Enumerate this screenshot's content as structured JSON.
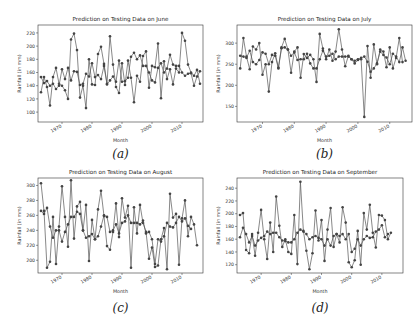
{
  "chart_data": [
    {
      "type": "line",
      "title": "Prediction on Testing Data on June",
      "xlabel": "Month",
      "ylabel": "Rainfall (in mm)",
      "caption": "(a)",
      "xticks": [
        "1970",
        "1980",
        "1990",
        "2000",
        "2010"
      ],
      "yticks": [
        "100",
        "120",
        "140",
        "160",
        "180",
        "200",
        "220"
      ],
      "ylim": [
        85,
        232
      ],
      "xlim": [
        1962,
        2017
      ],
      "x": [
        1963,
        1964,
        1965,
        1966,
        1967,
        1968,
        1969,
        1970,
        1971,
        1972,
        1973,
        1974,
        1975,
        1976,
        1977,
        1978,
        1979,
        1980,
        1981,
        1982,
        1983,
        1984,
        1985,
        1986,
        1987,
        1988,
        1989,
        1990,
        1991,
        1992,
        1993,
        1994,
        1995,
        1996,
        1997,
        1998,
        1999,
        2000,
        2001,
        2002,
        2003,
        2004,
        2005,
        2006,
        2007,
        2008,
        2009,
        2010,
        2011,
        2012,
        2013,
        2014,
        2015,
        2016
      ],
      "series": [
        {
          "name": "Actual",
          "values": [
            130,
            153,
            138,
            110,
            153,
            167,
            143,
            140,
            133,
            120,
            210,
            219,
            194,
            122,
            140,
            106,
            180,
            142,
            141,
            188,
            199,
            173,
            143,
            215,
            172,
            138,
            129,
            174,
            141,
            178,
            152,
            115,
            155,
            146,
            185,
            192,
            137,
            170,
            168,
            204,
            121,
            177,
            150,
            165,
            142,
            166,
            160,
            220,
            208,
            172,
            160,
            155,
            164,
            143,
            195,
            155,
            203,
            90,
            138,
            185,
            112,
            228,
            91
          ]
        },
        {
          "name": "Predicted",
          "values": [
            153,
            144,
            147,
            140,
            143,
            135,
            140,
            165,
            150,
            167,
            148,
            162,
            161,
            141,
            143,
            158,
            154,
            174,
            153,
            156,
            150,
            170,
            142,
            148,
            154,
            146,
            178,
            146,
            147,
            152,
            184,
            190,
            180,
            186,
            170,
            170,
            160,
            148,
            145,
            167,
            174,
            160,
            166,
            187,
            172,
            170,
            170,
            160,
            155,
            158,
            159,
            140,
            154,
            162,
            142,
            178,
            156,
            150,
            177,
            163,
            125,
            156,
            160,
            180
          ]
        }
      ]
    },
    {
      "type": "line",
      "title": "Prediction on Testing Data on July",
      "xlabel": "Month",
      "ylabel": "Rainfall (in mm)",
      "caption": "(b)",
      "xticks": [
        "1970",
        "1980",
        "1990",
        "2000",
        "2010"
      ],
      "yticks": [
        "150",
        "200",
        "250",
        "300"
      ],
      "ylim": [
        113,
        343
      ],
      "xlim": [
        1962,
        2017
      ],
      "x": [
        1963,
        1964,
        1965,
        1966,
        1967,
        1968,
        1969,
        1970,
        1971,
        1972,
        1973,
        1974,
        1975,
        1976,
        1977,
        1978,
        1979,
        1980,
        1981,
        1982,
        1983,
        1984,
        1985,
        1986,
        1987,
        1988,
        1989,
        1990,
        1991,
        1992,
        1993,
        1994,
        1995,
        1996,
        1997,
        1998,
        1999,
        2000,
        2001,
        2002,
        2003,
        2004,
        2005,
        2006,
        2007,
        2008,
        2009,
        2010,
        2011,
        2012,
        2013,
        2014,
        2015,
        2016
      ],
      "series": [
        {
          "name": "Actual",
          "values": [
            240,
            312,
            268,
            238,
            292,
            285,
            300,
            225,
            250,
            185,
            255,
            276,
            242,
            290,
            310,
            285,
            230,
            280,
            290,
            218,
            274,
            265,
            272,
            262,
            208,
            322,
            287,
            262,
            285,
            258,
            280,
            333,
            285,
            245,
            270,
            262,
            252,
            260,
            262,
            125,
            293,
            218,
            297,
            250,
            285,
            280,
            243,
            290,
            240,
            265,
            312,
            255
          ]
        },
        {
          "name": "Predicted",
          "values": [
            270,
            268,
            265,
            282,
            255,
            250,
            260,
            278,
            275,
            250,
            272,
            270,
            240,
            288,
            290,
            285,
            270,
            278,
            260,
            262,
            262,
            275,
            252,
            240,
            240,
            262,
            282,
            268,
            270,
            275,
            262,
            268,
            268,
            268,
            268,
            262,
            258,
            262,
            265,
            268,
            256,
            232,
            240,
            252,
            280,
            272,
            266,
            250,
            275,
            268,
            255,
            290,
            258
          ]
        }
      ]
    },
    {
      "type": "line",
      "title": "Prediction on Testing Data on August",
      "xlabel": "Month",
      "ylabel": "Rainfall (in mm)",
      "caption": "(c)",
      "xticks": [
        "1970",
        "1980",
        "1990",
        "2000",
        "2010"
      ],
      "yticks": [
        "200",
        "220",
        "240",
        "260",
        "280",
        "300"
      ],
      "ylim": [
        183,
        310
      ],
      "xlim": [
        1962,
        2017
      ],
      "x": [
        1963,
        1964,
        1965,
        1966,
        1967,
        1968,
        1969,
        1970,
        1971,
        1972,
        1973,
        1974,
        1975,
        1976,
        1977,
        1978,
        1979,
        1980,
        1981,
        1982,
        1983,
        1984,
        1985,
        1986,
        1987,
        1988,
        1989,
        1990,
        1991,
        1992,
        1993,
        1994,
        1995,
        1996,
        1997,
        1998,
        1999,
        2000,
        2001,
        2002,
        2003,
        2004,
        2005,
        2006,
        2007,
        2008,
        2009,
        2010,
        2011,
        2012,
        2013,
        2014,
        2015,
        2016
      ],
      "series": [
        {
          "name": "Actual",
          "values": [
            303,
            266,
            190,
            198,
            258,
            195,
            245,
            299,
            258,
            218,
            307,
            229,
            272,
            278,
            240,
            274,
            199,
            254,
            228,
            268,
            293,
            259,
            219,
            214,
            238,
            276,
            231,
            283,
            257,
            273,
            190,
            271,
            236,
            274,
            250,
            238,
            202,
            217,
            191,
            193,
            228,
            243,
            188,
            289,
            257,
            262,
            194,
            256,
            280,
            232,
            258,
            248,
            220
          ]
        },
        {
          "name": "Predicted",
          "values": [
            266,
            262,
            270,
            245,
            230,
            240,
            240,
            225,
            238,
            248,
            258,
            258,
            265,
            262,
            240,
            230,
            232,
            235,
            228,
            232,
            245,
            260,
            258,
            238,
            240,
            248,
            236,
            250,
            252,
            260,
            250,
            250,
            250,
            248,
            253,
            236,
            238,
            228,
            195,
            228,
            225,
            232,
            250,
            245,
            244,
            250,
            258,
            252,
            256,
            246,
            242
          ]
        }
      ]
    },
    {
      "type": "line",
      "title": "Prediction on Testing Data on September",
      "xlabel": "Month",
      "ylabel": "Rainfall (in mm)",
      "caption": "(d)",
      "xticks": [
        "1970",
        "1980",
        "1990",
        "2000",
        "2010"
      ],
      "yticks": [
        "120",
        "140",
        "160",
        "180",
        "200",
        "220",
        "240"
      ],
      "ylim": [
        107,
        256
      ],
      "xlim": [
        1962,
        2017
      ],
      "x": [
        1963,
        1964,
        1965,
        1966,
        1967,
        1968,
        1969,
        1970,
        1971,
        1972,
        1973,
        1974,
        1975,
        1976,
        1977,
        1978,
        1979,
        1980,
        1981,
        1982,
        1983,
        1984,
        1985,
        1986,
        1987,
        1988,
        1989,
        1990,
        1991,
        1992,
        1993,
        1994,
        1995,
        1996,
        1997,
        1998,
        1999,
        2000,
        2001,
        2002,
        2003,
        2004,
        2005,
        2006,
        2007,
        2008,
        2009,
        2010,
        2011,
        2012,
        2013,
        2014,
        2015,
        2016
      ],
      "series": [
        {
          "name": "Actual",
          "values": [
            198,
            201,
            143,
            138,
            168,
            134,
            170,
            206,
            160,
            129,
            186,
            140,
            227,
            181,
            148,
            160,
            140,
            137,
            198,
            121,
            250,
            173,
            142,
            113,
            138,
            205,
            158,
            190,
            126,
            175,
            209,
            148,
            168,
            155,
            210,
            186,
            124,
            116,
            127,
            173,
            120,
            201,
            175,
            214,
            170,
            147,
            198,
            197,
            190,
            160,
            170
          ]
        },
        {
          "name": "Predicted",
          "values": [
            163,
            178,
            168,
            155,
            165,
            150,
            158,
            162,
            165,
            172,
            168,
            170,
            170,
            163,
            158,
            157,
            155,
            155,
            160,
            170,
            175,
            172,
            168,
            160,
            163,
            165,
            162,
            160,
            150,
            160,
            150,
            165,
            168,
            165,
            168,
            160,
            168,
            140,
            145,
            160,
            150,
            160,
            165,
            162,
            163,
            172,
            175,
            182,
            163,
            168
          ]
        }
      ]
    }
  ]
}
